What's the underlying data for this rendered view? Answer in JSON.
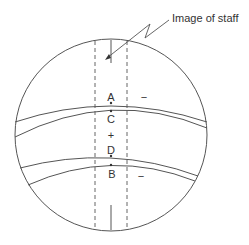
{
  "diagram": {
    "callout_label": "Image of staff",
    "points": {
      "A": "A",
      "B": "B",
      "C": "C",
      "D": "D"
    },
    "signs": {
      "center": "+",
      "upper_right": "−",
      "lower_right": "−"
    },
    "colors": {
      "line": "#555555",
      "text": "#333333",
      "background": "#ffffff"
    }
  }
}
